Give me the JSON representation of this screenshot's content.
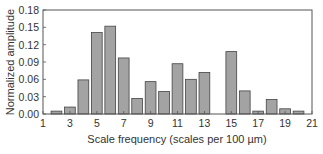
{
  "chart_data": {
    "type": "bar",
    "title": "",
    "xlabel": "Scale frequency (scales per 100 µm)",
    "ylabel": "Normalized amplitude",
    "xlim": [
      1,
      21
    ],
    "ylim": [
      0,
      0.18
    ],
    "x_ticks": [
      "1",
      "3",
      "5",
      "7",
      "9",
      "11",
      "13",
      "15",
      "17",
      "19",
      "21"
    ],
    "y_ticks": [
      "0.00",
      "0.03",
      "0.06",
      "0.09",
      "0.12",
      "0.15",
      "0.18"
    ],
    "grid": false,
    "legend": null,
    "bar_color": "#a3a3a3",
    "categories": [
      2,
      3,
      4,
      5,
      6,
      7,
      8,
      9,
      10,
      11,
      12,
      13,
      14,
      15,
      16,
      17,
      18,
      19,
      20
    ],
    "values": [
      0.005,
      0.012,
      0.059,
      0.141,
      0.152,
      0.097,
      0.027,
      0.056,
      0.039,
      0.087,
      0.06,
      0.072,
      0.0,
      0.108,
      0.04,
      0.005,
      0.025,
      0.009,
      0.005
    ]
  }
}
